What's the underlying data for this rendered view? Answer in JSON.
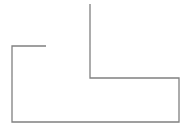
{
  "diagram": {
    "background": "#ffffff",
    "stroke_color": "#808080",
    "stroke_width": 1.3,
    "path_points": [
      [
        90,
        4
      ],
      [
        90,
        78
      ],
      [
        179,
        78
      ],
      [
        179,
        122
      ],
      [
        12,
        122
      ],
      [
        12,
        46
      ],
      [
        46,
        46
      ]
    ]
  }
}
